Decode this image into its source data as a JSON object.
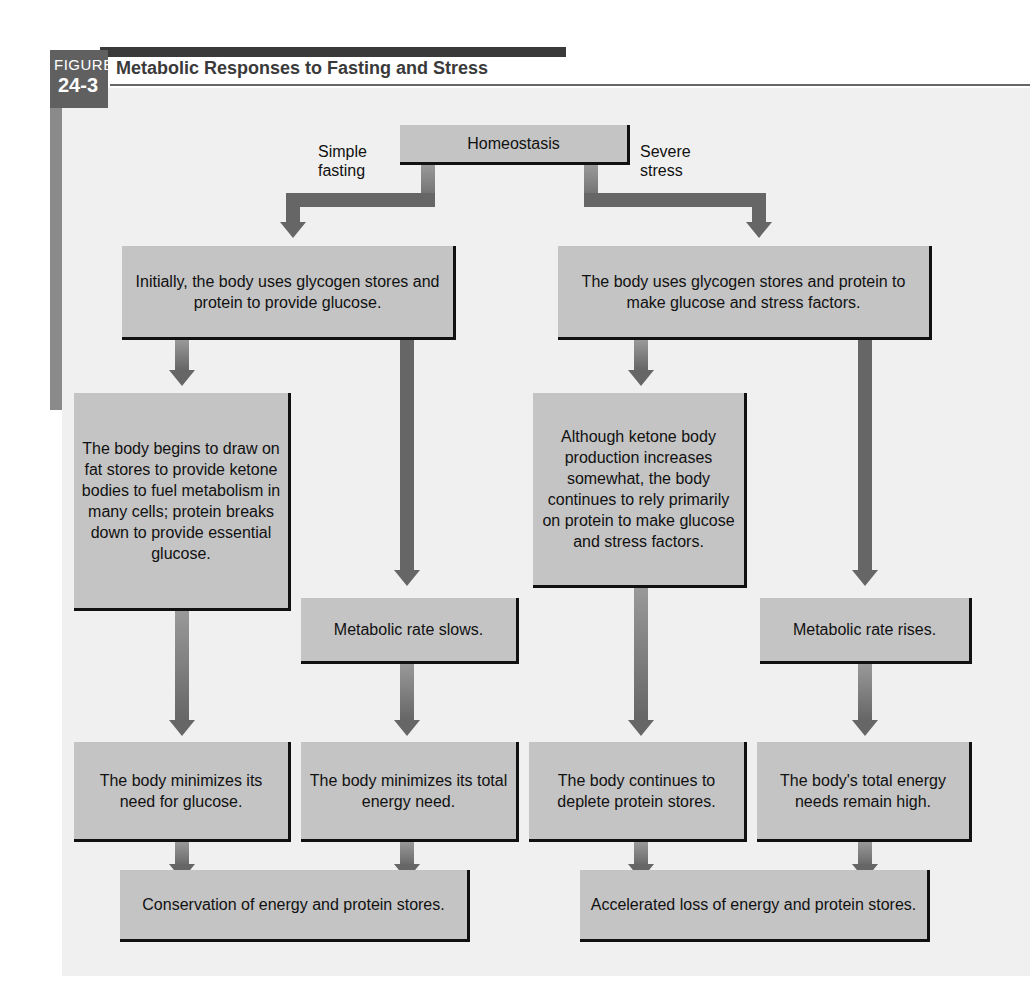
{
  "figure": {
    "label": "FIGURE",
    "number": "24-3",
    "title": "Metabolic Responses to Fasting and Stress"
  },
  "top": {
    "root": "Homeostasis",
    "left_branch": [
      "Simple",
      "fasting"
    ],
    "right_branch": [
      "Severe",
      "stress"
    ]
  },
  "fasting": {
    "initial": "Initially, the body uses glycogen stores and protein to provide glucose.",
    "fat_stores": "The body begins to draw on fat stores to provide ketone bodies to fuel metabolism in many cells; protein breaks down to provide essential glucose.",
    "metabolic_rate": "Metabolic rate slows.",
    "minimize_glucose": "The body minimizes its need for glucose.",
    "minimize_energy": "The body minimizes its total energy need.",
    "outcome": "Conservation of energy and protein stores."
  },
  "stress": {
    "initial": "The body uses glycogen stores and protein to make glucose and stress factors.",
    "ketone": "Although ketone body production increases somewhat, the body continues to rely primarily on protein to make glucose and stress factors.",
    "metabolic_rate": "Metabolic rate rises.",
    "deplete_protein": "The body continues to deplete protein stores.",
    "energy_high": "The body's total energy needs remain high.",
    "outcome": "Accelerated loss of energy and protein stores."
  },
  "colors": {
    "box_fill": "#c4c4c4",
    "arrow": "#666666",
    "panel": "#f0f0f0",
    "figure_tag": "#606060"
  }
}
